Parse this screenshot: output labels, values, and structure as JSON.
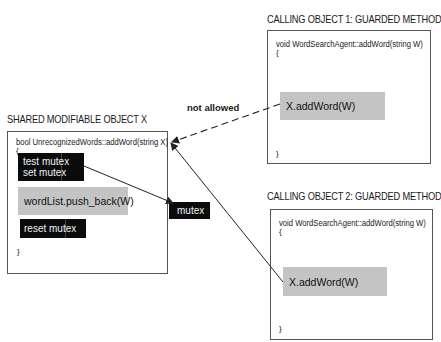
{
  "shared_object": {
    "title": "SHARED MODIFIABLE OBJECT X",
    "signature": "bool UnrecognizedWords::addWord(string X)",
    "open_brace": "{",
    "close_brace": "}",
    "lock_block": {
      "line1": "test mutex",
      "line2": "set mutex"
    },
    "body_statement": "wordList.push_back(W)",
    "unlock_block": "reset mutex"
  },
  "mutex": {
    "label": "mutex"
  },
  "calling_object_1": {
    "title": "CALLING OBJECT 1: GUARDED METHOD",
    "signature": "void WordSearchAgent::addWord(string W)",
    "open_brace": "{",
    "close_brace": "}",
    "call": "X.addWord(W)"
  },
  "calling_object_2": {
    "title": "CALLING OBJECT 2: GUARDED METHOD",
    "signature": "void WordSearchAgent::addWord(string W)",
    "open_brace": "{",
    "close_brace": "}",
    "call": "X.addWord(W)"
  },
  "edges": {
    "not_allowed_label": "not allowed"
  },
  "colors": {
    "black_block": "#0b0b0b",
    "gray_block": "#c4c4c4",
    "frame_border": "#555555",
    "arrow": "#222222"
  }
}
